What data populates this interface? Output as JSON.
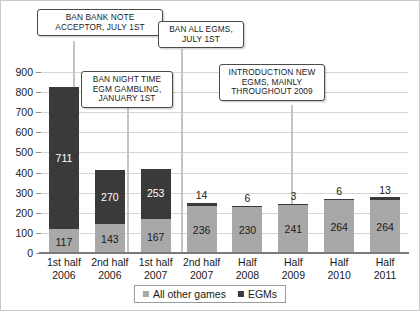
{
  "chart_data": {
    "type": "bar",
    "stacked": true,
    "title": "",
    "xlabel": "",
    "ylabel": "",
    "ylim": [
      0,
      900
    ],
    "ytick_step": 100,
    "yticks": [
      900,
      800,
      700,
      600,
      500,
      400,
      300,
      200,
      100,
      0
    ],
    "grid": true,
    "legend_position": "bottom",
    "categories": [
      "1st half 2006",
      "2nd half 2006",
      "1st half 2007",
      "2nd half 2007",
      "Half 2008",
      "Half 2009",
      "Half 2010",
      "Half 2011"
    ],
    "category_lines": [
      [
        "1st half",
        "2006"
      ],
      [
        "2nd half",
        "2006"
      ],
      [
        "1st half",
        "2007"
      ],
      [
        "2nd half",
        "2007"
      ],
      [
        "Half",
        "2008"
      ],
      [
        "Half",
        "2009"
      ],
      [
        "Half",
        "2010"
      ],
      [
        "Half",
        "2011"
      ]
    ],
    "series": [
      {
        "name": "All other games",
        "color": "#a8a8a8",
        "values": [
          117,
          143,
          167,
          236,
          230,
          241,
          264,
          264
        ]
      },
      {
        "name": "EGMs",
        "color": "#3a3a3a",
        "values": [
          711,
          270,
          253,
          14,
          6,
          3,
          6,
          13
        ]
      }
    ],
    "totals": [
      828,
      413,
      420,
      250,
      236,
      244,
      270,
      277
    ],
    "annotations": [
      {
        "id": "ban-bank-note-acceptor",
        "lines": [
          "BAN BANK NOTE",
          "ACCEPTOR, JULY 1ST"
        ],
        "target_category": "2nd half 2006"
      },
      {
        "id": "ban-night-time-egm-gambling",
        "lines": [
          "BAN NIGHT TIME",
          "EGM GAMBLING,",
          "JANUARY 1ST"
        ],
        "target_category": "1st half 2007"
      },
      {
        "id": "ban-all-egms",
        "lines": [
          "BAN ALL EGMS,",
          "JULY 1ST"
        ],
        "target_category": "2nd half 2007"
      },
      {
        "id": "introduction-new-egms",
        "lines": [
          "INTRODUCTION NEW",
          "EGMS, MAINLY",
          "THROUGHOUT 2009"
        ],
        "target_category": "Half 2010"
      }
    ]
  },
  "legend": {
    "items": [
      {
        "label": "All other games",
        "color": "#a8a8a8"
      },
      {
        "label": "EGMs",
        "color": "#3a3a3a"
      }
    ]
  },
  "colors": {
    "light_gray": "#a8a8a8",
    "dark_gray": "#3a3a3a",
    "gridline": "#d6d6d6",
    "axis": "#7a7a7a",
    "leader": "#c4c4c4",
    "callout_border": "#4a4a4a",
    "text": "#1a1a1a"
  }
}
